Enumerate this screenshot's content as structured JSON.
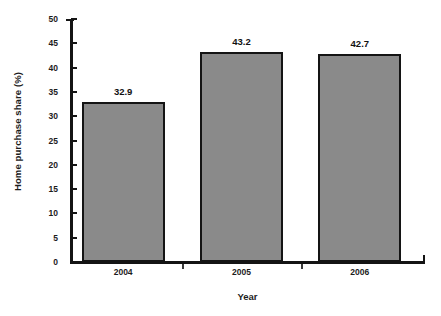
{
  "chart_data": {
    "type": "bar",
    "title": "",
    "subtitle": "",
    "xlabel": "Year",
    "ylabel": "Home purchase share (%)",
    "categories": [
      "2004",
      "2005",
      "2006"
    ],
    "values": [
      32.9,
      43.2,
      42.7
    ],
    "data_labels": [
      "32.9",
      "43.2",
      "42.7"
    ],
    "ylim": [
      0,
      50
    ],
    "ytick_step": 5,
    "ytick_labels": [
      "0",
      "5",
      "10",
      "15",
      "20",
      "25",
      "30",
      "35",
      "40",
      "45",
      "50"
    ],
    "grid": false,
    "legend": false,
    "legend_position": "none",
    "bar_fill_color": "#8a8a8a",
    "bar_border_color": "#141414",
    "axis_color": "#141414",
    "background_color": "#ffffff",
    "series": [
      {
        "name": "Home purchase share",
        "values": [
          32.9,
          43.2,
          42.7
        ]
      }
    ]
  }
}
